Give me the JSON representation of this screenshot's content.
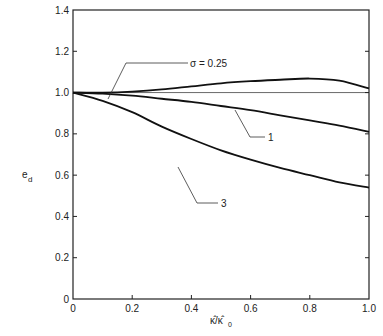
{
  "chart_data": {
    "type": "line",
    "title": "",
    "xlabel": "κ̂/κ̂₀",
    "ylabel": "e_d",
    "xlim": [
      0,
      1.0
    ],
    "ylim": [
      0,
      1.4
    ],
    "grid": false,
    "legend": "inline curve labels",
    "x_ticks": [
      "0",
      "0.2",
      "0.4",
      "0.6",
      "0.8",
      "1.0"
    ],
    "y_ticks": [
      "0",
      "0.2",
      "0.4",
      "0.6",
      "0.8",
      "1.0",
      "1.2",
      "1.4"
    ],
    "reference_line": {
      "y": 1.0,
      "label": ""
    },
    "x": [
      0,
      0.1,
      0.2,
      0.3,
      0.4,
      0.5,
      0.6,
      0.7,
      0.8,
      0.9,
      1.0
    ],
    "series": [
      {
        "name": "σ = 0.25",
        "label": "σ = 0.25",
        "values": [
          1.0,
          1.0,
          1.005,
          1.015,
          1.03,
          1.045,
          1.055,
          1.062,
          1.068,
          1.058,
          1.02
        ]
      },
      {
        "name": "1",
        "label": "1",
        "values": [
          1.0,
          0.995,
          0.985,
          0.97,
          0.955,
          0.935,
          0.915,
          0.89,
          0.865,
          0.84,
          0.81
        ]
      },
      {
        "name": "3",
        "label": "3",
        "values": [
          1.0,
          0.96,
          0.905,
          0.835,
          0.775,
          0.72,
          0.675,
          0.635,
          0.6,
          0.565,
          0.54
        ]
      }
    ]
  },
  "axes": {
    "ylabel_main": "e",
    "ylabel_sub": "d",
    "xlabel_text": "κ̂/κ̂",
    "xlabel_sub": "0"
  },
  "annotations": {
    "sigma_025": "σ = 0.25",
    "sigma_1": "1",
    "sigma_3": "3"
  }
}
